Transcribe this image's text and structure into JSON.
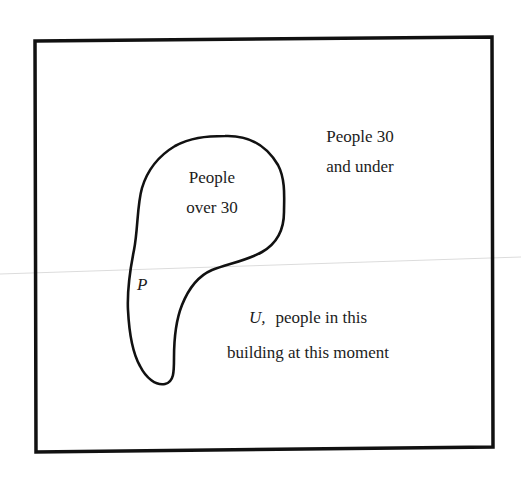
{
  "diagram": {
    "type": "venn-diagram",
    "universe": {
      "symbol": "U,",
      "label_lines": [
        "people in this",
        "building at this moment"
      ]
    },
    "subset": {
      "symbol": "P",
      "label_lines": [
        "People",
        "over 30"
      ]
    },
    "complement": {
      "label_lines": [
        "People 30",
        "and under"
      ]
    },
    "colors": {
      "stroke": "#111111",
      "background": "#ffffff",
      "scan_line": "#d8d8d8"
    }
  }
}
